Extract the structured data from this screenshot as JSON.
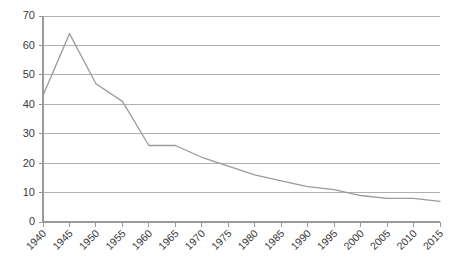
{
  "chart_data": {
    "type": "line",
    "title": "",
    "xlabel": "",
    "ylabel": "",
    "x": [
      1940,
      1945,
      1950,
      1955,
      1960,
      1965,
      1970,
      1975,
      1980,
      1985,
      1990,
      1995,
      2000,
      2005,
      2010,
      2015
    ],
    "categories": [
      "1940",
      "1945",
      "1950",
      "1955",
      "1960",
      "1965",
      "1970",
      "1975",
      "1980",
      "1985",
      "1990",
      "1995",
      "2000",
      "2005",
      "2010",
      "2015"
    ],
    "values": [
      43,
      64,
      47,
      41,
      26,
      26,
      22,
      19,
      16,
      14,
      12,
      11,
      9,
      8,
      8,
      7
    ],
    "series": [
      {
        "name": "series-1",
        "values": [
          43,
          64,
          47,
          41,
          26,
          26,
          22,
          19,
          16,
          14,
          12,
          11,
          9,
          8,
          8,
          7
        ],
        "color": "#9a9a9a"
      }
    ],
    "ylim": [
      0,
      70
    ],
    "ytick_labels": [
      "0",
      "10",
      "20",
      "30",
      "40",
      "50",
      "60",
      "70"
    ],
    "ytick_values": [
      0,
      10,
      20,
      30,
      40,
      50,
      60,
      70
    ],
    "grid": true,
    "legend": "none",
    "xtick_rotation_deg": 45
  },
  "colors": {
    "line": "#9a9a9a",
    "grid": "#b0b0b0",
    "axis": "#9a9a9a",
    "text": "#3a3a3a",
    "background": "#ffffff"
  }
}
